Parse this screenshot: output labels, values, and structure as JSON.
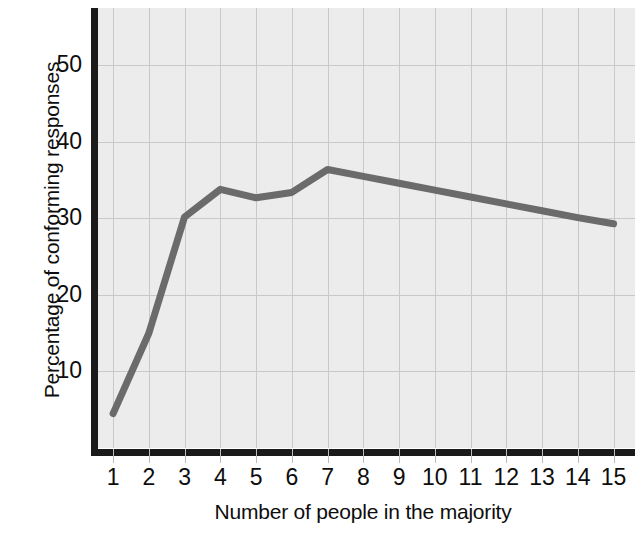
{
  "chart_data": {
    "type": "line",
    "title": "",
    "subtitle": "",
    "xlabel": "Number of people in the majority",
    "ylabel": "Percentage of conforming responses",
    "x": [
      1,
      2,
      3,
      4,
      5,
      6,
      7,
      8,
      9,
      10,
      11,
      12,
      13,
      14,
      15
    ],
    "xtick_labels": [
      "1",
      "2",
      "3",
      "4",
      "5",
      "6",
      "7",
      "8",
      "9",
      "10",
      "11",
      "12",
      "13",
      "14",
      "15"
    ],
    "ytick_labels": [
      "10",
      "20",
      "30",
      "40",
      "50"
    ],
    "yticks": [
      10,
      20,
      30,
      40,
      50
    ],
    "values": [
      4.5,
      15.0,
      30.2,
      33.8,
      32.7,
      33.4,
      36.4,
      35.5,
      34.6,
      33.7,
      32.8,
      31.9,
      31.0,
      30.1,
      29.3
    ],
    "series": [
      {
        "name": "Percentage of conforming responses",
        "values": [
          4.5,
          15.0,
          30.2,
          33.8,
          32.7,
          33.4,
          36.4,
          35.5,
          34.6,
          33.7,
          32.8,
          31.9,
          31.0,
          30.1,
          29.3
        ]
      }
    ],
    "xlim": [
      0.55,
      15.6
    ],
    "ylim": [
      0,
      57.5
    ],
    "grid": true,
    "legend": false,
    "legend_position": "none",
    "line_color": "#6b6b6b",
    "plot_background": "#ececec",
    "grid_color": "#c9c9c9",
    "axis_color": "#1a1a1a",
    "text_color": "#0d0d0d",
    "annotations": []
  }
}
